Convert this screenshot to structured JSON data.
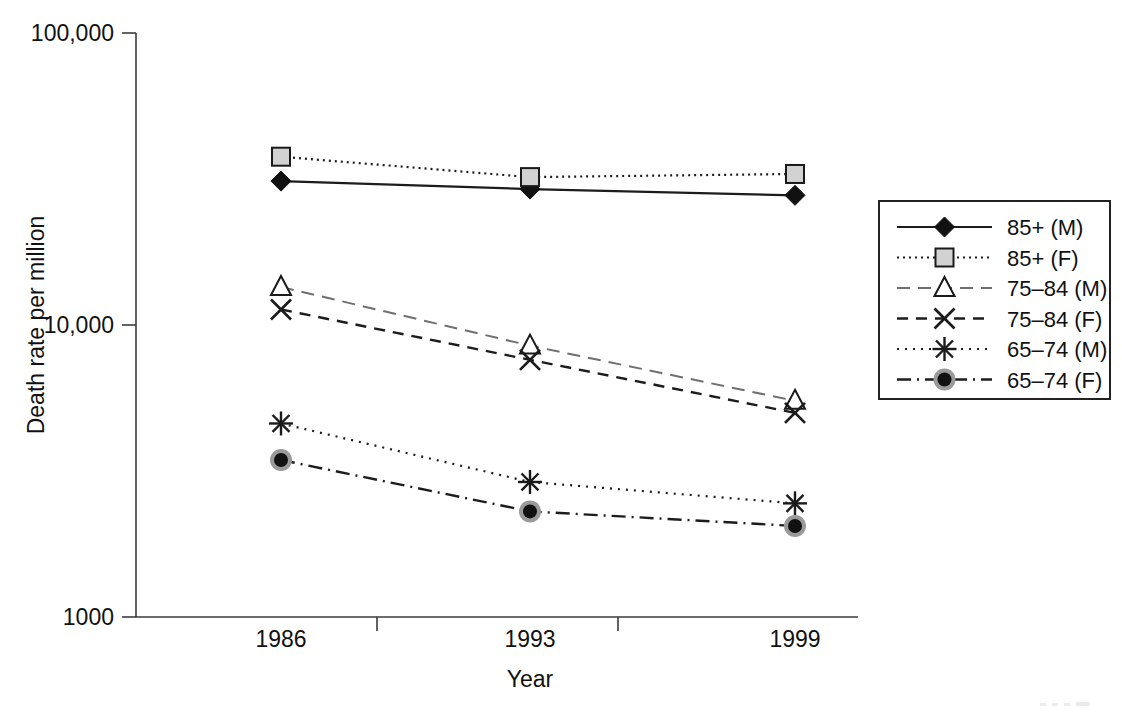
{
  "chart_data": {
    "type": "line",
    "title": "",
    "xlabel": "Year",
    "ylabel": "Death rate per million",
    "x": [
      "1986",
      "1993",
      "1999"
    ],
    "categories": [
      "1986",
      "1993",
      "1999"
    ],
    "yscale": "log",
    "ylim": [
      1000,
      100000
    ],
    "ytick_values": [
      1000,
      10000,
      100000
    ],
    "ytick_labels": [
      "1000",
      "10,000",
      "100,000"
    ],
    "xtick_labels": [
      "1986",
      "1993",
      "1999"
    ],
    "grid": false,
    "legend_position": "right",
    "series": [
      {
        "name": "85+ (M)",
        "values": [
          31100,
          29200,
          27800
        ],
        "marker": "diamond",
        "line": "solid"
      },
      {
        "name": "85+ (F)",
        "values": [
          37700,
          32100,
          32900
        ],
        "marker": "square",
        "line": "dot-fine"
      },
      {
        "name": "75–84 (M)",
        "values": [
          13500,
          8500,
          5500
        ],
        "marker": "triangle",
        "line": "dash-long"
      },
      {
        "name": "75–84 (F)",
        "values": [
          11300,
          7600,
          5000
        ],
        "marker": "x",
        "line": "dash-med"
      },
      {
        "name": "65–74 (M)",
        "values": [
          4600,
          2900,
          2450
        ],
        "marker": "star",
        "line": "dot-sparse"
      },
      {
        "name": "65–74 (F)",
        "values": [
          3450,
          2300,
          2050
        ],
        "marker": "circle",
        "line": "dashdot"
      }
    ]
  },
  "axes": {
    "y_label": "Death rate per million",
    "x_label": "Year",
    "y_ticks": [
      "100,000",
      "10,000",
      "1000"
    ],
    "x_ticks": [
      "1986",
      "1993",
      "1999"
    ]
  },
  "legend": {
    "items": [
      {
        "label": "85+ (M)"
      },
      {
        "label": "85+ (F)"
      },
      {
        "label": "75–84 (M)"
      },
      {
        "label": "75–84 (F)"
      },
      {
        "label": "65–74 (M)"
      },
      {
        "label": "65–74 (F)"
      }
    ]
  }
}
